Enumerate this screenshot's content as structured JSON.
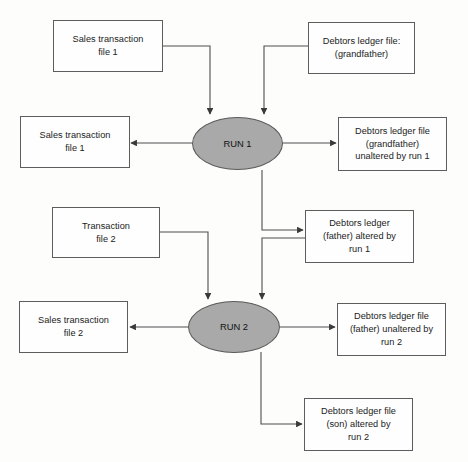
{
  "diagram": {
    "background_color": "#fdfdfc",
    "box_fill": "#fefefe",
    "box_border_color": "#5d5d5d",
    "process_fill": "#a9a9a9",
    "line_color": "#4f4f4f",
    "nodes": [
      {
        "id": "sales-transaction-file-1-in",
        "label": "Sales transaction\nfile 1"
      },
      {
        "id": "debtors-ledger-grandfather",
        "label": "Debtors ledger file:\n(grandfather)"
      },
      {
        "id": "sales-transaction-file-1-out",
        "label": "Sales transaction\nfile 1"
      },
      {
        "id": "run-1",
        "label": "RUN 1"
      },
      {
        "id": "debtors-grandfather-unaltered",
        "label": "Debtors ledger file\n(grandfather)\nunaltered by run 1"
      },
      {
        "id": "transaction-file-2-in",
        "label": "Transaction\nfile 2"
      },
      {
        "id": "debtors-father-altered",
        "label": "Debtors ledger\n(father) altered by\nrun 1"
      },
      {
        "id": "sales-transaction-file-2-out",
        "label": "Sales transaction\nfile 2"
      },
      {
        "id": "run-2",
        "label": "RUN 2"
      },
      {
        "id": "debtors-father-unaltered",
        "label": "Debtors ledger file\n(father) unaltered by\nrun 2"
      },
      {
        "id": "debtors-son-altered",
        "label": "Debtors ledger file\n(son) altered by\nrun 2"
      }
    ],
    "edges": [
      {
        "from": "sales-transaction-file-1-in",
        "to": "run-1"
      },
      {
        "from": "debtors-ledger-grandfather",
        "to": "run-1"
      },
      {
        "from": "run-1",
        "to": "sales-transaction-file-1-out"
      },
      {
        "from": "run-1",
        "to": "debtors-grandfather-unaltered"
      },
      {
        "from": "run-1",
        "to": "debtors-father-altered"
      },
      {
        "from": "debtors-father-altered",
        "to": "run-2"
      },
      {
        "from": "transaction-file-2-in",
        "to": "run-2"
      },
      {
        "from": "run-2",
        "to": "sales-transaction-file-2-out"
      },
      {
        "from": "run-2",
        "to": "debtors-father-unaltered"
      },
      {
        "from": "run-2",
        "to": "debtors-son-altered"
      }
    ]
  }
}
